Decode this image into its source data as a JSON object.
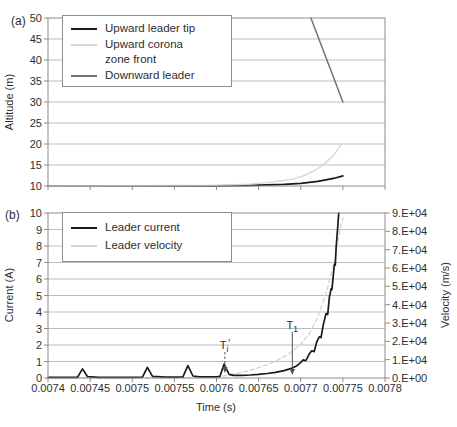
{
  "figure": {
    "colors": {
      "frame": "#8c8c8c",
      "grid": "#bdbdbd",
      "text": "#2e2e2e",
      "black_series": "#1a1a1a",
      "light_series": "#d8d8c8",
      "gray_series": "#737373",
      "annotation": "#555555"
    }
  },
  "x_axis": {
    "title": "Time (s)",
    "min": 0.0074,
    "max": 0.0078,
    "tick_values": [
      0.0074,
      0.00745,
      0.0075,
      0.00755,
      0.0076,
      0.00765,
      0.0077,
      0.00775,
      0.0078
    ],
    "tick_labels": [
      "0.0074",
      "0.00745",
      "0.0075",
      "0.00755",
      "0.0076",
      "0.00765",
      "0.0077",
      "0.00775",
      "0.0078"
    ]
  },
  "panel_a": {
    "label": "(a)",
    "y_axis": {
      "title": "Altitude (m)",
      "min": 10,
      "max": 50,
      "tick_values": [
        10,
        15,
        20,
        25,
        30,
        35,
        40,
        45,
        50
      ],
      "tick_labels": [
        "10",
        "15",
        "20",
        "25",
        "30",
        "35",
        "40",
        "45",
        "50"
      ]
    },
    "legend": [
      {
        "label": "Upward leader tip",
        "color": "#1a1a1a",
        "style": "solid"
      },
      {
        "label": "Upward corona zone front",
        "color": "#d8d8c8",
        "style": "solid"
      },
      {
        "label": "Downward leader",
        "color": "#737373",
        "style": "solid"
      }
    ]
  },
  "panel_b": {
    "label": "(b)",
    "y_left": {
      "title": "Current (A)",
      "min": 0,
      "max": 10,
      "tick_values": [
        0,
        1,
        2,
        3,
        4,
        5,
        6,
        7,
        8,
        9,
        10
      ],
      "tick_labels": [
        "0",
        "1",
        "2",
        "3",
        "4",
        "5",
        "6",
        "7",
        "8",
        "9",
        "10"
      ]
    },
    "y_right": {
      "title": "Velocity (m/s)",
      "min": 0,
      "max": 90000,
      "tick_values": [
        0,
        10000,
        20000,
        30000,
        40000,
        50000,
        60000,
        70000,
        80000,
        90000
      ],
      "tick_labels": [
        "0.E+00",
        "1.E+04",
        "2.E+04",
        "3.E+04",
        "4.E+04",
        "5.E+04",
        "6.E+04",
        "7.E+04",
        "8.E+04",
        "9.E+04"
      ]
    },
    "legend": [
      {
        "label": "Leader current",
        "color": "#1a1a1a",
        "style": "solid"
      },
      {
        "label": "Leader velocity",
        "color": "#d8d8c8",
        "style": "dashed"
      }
    ],
    "annotations": [
      {
        "base": "T",
        "sub": "i",
        "suffix": "′",
        "x": 0.00761,
        "line_style": "dashed"
      },
      {
        "base": "T",
        "sub": "1",
        "suffix": "",
        "x": 0.00769,
        "line_style": "solid"
      }
    ]
  },
  "chart_data": [
    {
      "type": "line",
      "panel": "a",
      "title": "",
      "xlabel": "Time (s)",
      "ylabel": "Altitude (m)",
      "xlim": [
        0.0074,
        0.0078
      ],
      "ylim": [
        10,
        50
      ],
      "grid": true,
      "legend_position": "top-left",
      "series": [
        {
          "name": "Upward leader tip",
          "color": "#1a1a1a",
          "style": "solid",
          "width": 1.7,
          "points": [
            [
              0.0074,
              10.0
            ],
            [
              0.0075,
              10.0
            ],
            [
              0.00755,
              10.0
            ],
            [
              0.0076,
              10.05
            ],
            [
              0.00762,
              10.1
            ],
            [
              0.00764,
              10.15
            ],
            [
              0.00766,
              10.25
            ],
            [
              0.00768,
              10.4
            ],
            [
              0.0077,
              10.65
            ],
            [
              0.00771,
              10.85
            ],
            [
              0.00772,
              11.1
            ],
            [
              0.00773,
              11.45
            ],
            [
              0.00774,
              11.85
            ],
            [
              0.00775,
              12.4
            ]
          ]
        },
        {
          "name": "Upward corona zone front",
          "color": "#d8d8c8",
          "style": "solid",
          "width": 1.4,
          "points": [
            [
              0.0074,
              10.0
            ],
            [
              0.0075,
              10.05
            ],
            [
              0.0076,
              10.2
            ],
            [
              0.00762,
              10.3
            ],
            [
              0.00764,
              10.45
            ],
            [
              0.00766,
              10.8
            ],
            [
              0.00768,
              11.3
            ],
            [
              0.00769,
              11.65
            ],
            [
              0.0077,
              12.2
            ],
            [
              0.00771,
              13.0
            ],
            [
              0.00772,
              14.1
            ],
            [
              0.00773,
              15.6
            ],
            [
              0.00774,
              17.6
            ],
            [
              0.007748,
              19.9
            ]
          ]
        },
        {
          "name": "Downward leader",
          "color": "#737373",
          "style": "solid",
          "width": 1.5,
          "points": [
            [
              0.007712,
              50
            ],
            [
              0.00775,
              30
            ]
          ]
        }
      ]
    },
    {
      "type": "line",
      "panel": "b",
      "title": "",
      "xlabel": "Time (s)",
      "ylabel_left": "Current (A)",
      "ylabel_right": "Velocity (m/s)",
      "xlim": [
        0.0074,
        0.0078
      ],
      "ylim_left": [
        0,
        10
      ],
      "ylim_right": [
        0,
        90000
      ],
      "grid": true,
      "legend_position": "top-left",
      "series": [
        {
          "name": "Leader current",
          "axis": "left",
          "color": "#1a1a1a",
          "style": "solid",
          "width": 1.7,
          "points": [
            [
              0.0074,
              0.04
            ],
            [
              0.007435,
              0.04
            ],
            [
              0.007441,
              0.55
            ],
            [
              0.007447,
              0.08
            ],
            [
              0.00746,
              0.04
            ],
            [
              0.0075,
              0.04
            ],
            [
              0.007512,
              0.05
            ],
            [
              0.007518,
              0.65
            ],
            [
              0.007524,
              0.1
            ],
            [
              0.00754,
              0.05
            ],
            [
              0.00756,
              0.05
            ],
            [
              0.007566,
              0.75
            ],
            [
              0.007572,
              0.12
            ],
            [
              0.00758,
              0.07
            ],
            [
              0.0076,
              0.07
            ],
            [
              0.007604,
              0.1
            ],
            [
              0.007609,
              0.85
            ],
            [
              0.007615,
              0.22
            ],
            [
              0.00762,
              0.16
            ],
            [
              0.00763,
              0.16
            ],
            [
              0.00764,
              0.18
            ],
            [
              0.00765,
              0.22
            ],
            [
              0.00766,
              0.27
            ],
            [
              0.00767,
              0.34
            ],
            [
              0.00768,
              0.45
            ],
            [
              0.00769,
              0.6
            ],
            [
              0.007695,
              0.72
            ],
            [
              0.0077,
              0.95
            ],
            [
              0.007703,
              1.1
            ],
            [
              0.007706,
              1.05
            ],
            [
              0.00771,
              1.45
            ],
            [
              0.007713,
              1.65
            ],
            [
              0.007716,
              1.6
            ],
            [
              0.007719,
              2.2
            ],
            [
              0.007722,
              2.5
            ],
            [
              0.007724,
              2.45
            ],
            [
              0.007727,
              3.3
            ],
            [
              0.00773,
              3.9
            ],
            [
              0.007732,
              3.85
            ],
            [
              0.007734,
              4.9
            ],
            [
              0.007736,
              5.4
            ],
            [
              0.007737,
              5.35
            ],
            [
              0.007739,
              6.4
            ],
            [
              0.00774,
              6.9
            ],
            [
              0.007741,
              6.85
            ],
            [
              0.007742,
              7.9
            ],
            [
              0.007743,
              8.6
            ],
            [
              0.007744,
              9.2
            ],
            [
              0.007745,
              10.0
            ]
          ]
        },
        {
          "name": "Leader velocity",
          "axis": "right",
          "color": "#d8d8c8",
          "style": "dashed",
          "width": 1.4,
          "points": [
            [
              0.0074,
              0
            ],
            [
              0.00755,
              0
            ],
            [
              0.0076,
              500
            ],
            [
              0.00761,
              1200
            ],
            [
              0.00762,
              2000
            ],
            [
              0.00763,
              3000
            ],
            [
              0.00764,
              4200
            ],
            [
              0.00765,
              5600
            ],
            [
              0.00766,
              7200
            ],
            [
              0.00767,
              9200
            ],
            [
              0.00768,
              11500
            ],
            [
              0.00769,
              14500
            ],
            [
              0.0077,
              18500
            ],
            [
              0.00771,
              24000
            ],
            [
              0.00772,
              33000
            ],
            [
              0.00773,
              46000
            ],
            [
              0.00774,
              64000
            ],
            [
              0.007748,
              84000
            ],
            [
              0.00775,
              87000
            ]
          ]
        }
      ]
    }
  ]
}
